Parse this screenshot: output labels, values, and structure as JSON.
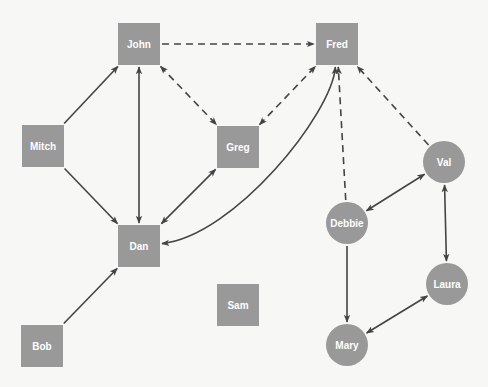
{
  "diagram": {
    "type": "sociogram",
    "colors": {
      "node": "#999999",
      "edge": "#444444",
      "label": "#ffffff",
      "background": "#f7f7f5"
    },
    "nodes": [
      {
        "id": "john",
        "label": "John",
        "shape": "square",
        "x": 139,
        "y": 44
      },
      {
        "id": "fred",
        "label": "Fred",
        "shape": "square",
        "x": 337,
        "y": 44
      },
      {
        "id": "mitch",
        "label": "Mitch",
        "shape": "square",
        "x": 43,
        "y": 146
      },
      {
        "id": "greg",
        "label": "Greg",
        "shape": "square",
        "x": 238,
        "y": 147
      },
      {
        "id": "dan",
        "label": "Dan",
        "shape": "square",
        "x": 139,
        "y": 246
      },
      {
        "id": "sam",
        "label": "Sam",
        "shape": "square",
        "x": 238,
        "y": 305
      },
      {
        "id": "bob",
        "label": "Bob",
        "shape": "square",
        "x": 42,
        "y": 346
      },
      {
        "id": "val",
        "label": "Val",
        "shape": "circle",
        "x": 444,
        "y": 162
      },
      {
        "id": "debbie",
        "label": "Debbie",
        "shape": "circle",
        "x": 347,
        "y": 223
      },
      {
        "id": "laura",
        "label": "Laura",
        "shape": "circle",
        "x": 447,
        "y": 284
      },
      {
        "id": "mary",
        "label": "Mary",
        "shape": "circle",
        "x": 347,
        "y": 345
      }
    ],
    "edges": [
      {
        "from": "john",
        "to": "fred",
        "style": "dashed",
        "direction": "forward"
      },
      {
        "from": "mitch",
        "to": "john",
        "style": "solid",
        "direction": "forward"
      },
      {
        "from": "mitch",
        "to": "dan",
        "style": "solid",
        "direction": "forward"
      },
      {
        "from": "john",
        "to": "dan",
        "style": "solid",
        "direction": "both"
      },
      {
        "from": "john",
        "to": "greg",
        "style": "dashed",
        "direction": "both"
      },
      {
        "from": "greg",
        "to": "fred",
        "style": "dashed",
        "direction": "both"
      },
      {
        "from": "dan",
        "to": "greg",
        "style": "solid",
        "direction": "both"
      },
      {
        "from": "dan",
        "to": "fred",
        "style": "solid",
        "direction": "both",
        "curved": true
      },
      {
        "from": "bob",
        "to": "dan",
        "style": "solid",
        "direction": "forward"
      },
      {
        "from": "debbie",
        "to": "fred",
        "style": "dashed",
        "direction": "forward"
      },
      {
        "from": "val",
        "to": "fred",
        "style": "dashed",
        "direction": "forward"
      },
      {
        "from": "debbie",
        "to": "val",
        "style": "solid",
        "direction": "both"
      },
      {
        "from": "debbie",
        "to": "mary",
        "style": "solid",
        "direction": "forward"
      },
      {
        "from": "val",
        "to": "laura",
        "style": "solid",
        "direction": "both"
      },
      {
        "from": "laura",
        "to": "mary",
        "style": "solid",
        "direction": "both"
      }
    ]
  }
}
